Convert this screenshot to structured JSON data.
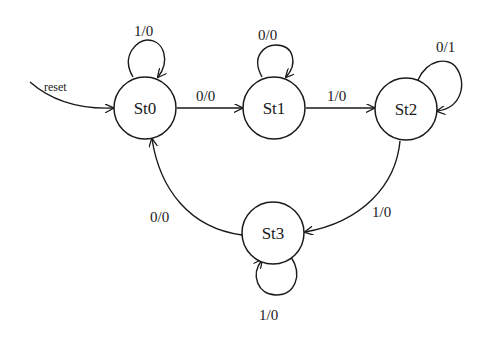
{
  "diagram": {
    "type": "finite-state-machine",
    "states": [
      {
        "id": "st0",
        "label": "St0",
        "initial": true
      },
      {
        "id": "st1",
        "label": "St1"
      },
      {
        "id": "st2",
        "label": "St2"
      },
      {
        "id": "st3",
        "label": "St3"
      }
    ],
    "initial_arrow": {
      "label": "reset",
      "to": "St0"
    },
    "transitions": [
      {
        "from": "St0",
        "to": "St0",
        "label": "1/0"
      },
      {
        "from": "St0",
        "to": "St1",
        "label": "0/0"
      },
      {
        "from": "St1",
        "to": "St1",
        "label": "0/0"
      },
      {
        "from": "St1",
        "to": "St2",
        "label": "1/0"
      },
      {
        "from": "St2",
        "to": "St2",
        "label": "0/1"
      },
      {
        "from": "St2",
        "to": "St3",
        "label": "1/0"
      },
      {
        "from": "St3",
        "to": "St3",
        "label": "1/0"
      },
      {
        "from": "St3",
        "to": "St0",
        "label": "0/0"
      }
    ]
  }
}
